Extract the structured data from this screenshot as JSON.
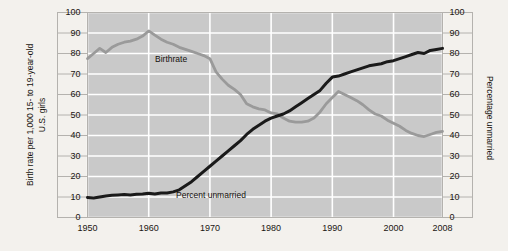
{
  "figure": {
    "background_color": "#f3f1ed",
    "plot_background_color": "#c9c9c9",
    "gridline_color": "#ffffff",
    "frame_color": "#b4b2ae"
  },
  "labels": {
    "left_axis_line1": "Birth rate per 1,000 15- to 19-year-old",
    "left_axis_line2": "U.S. girls",
    "right_axis": "Percentage unmarried",
    "birthrate_label": "Birthrate",
    "unmarried_label": "Percent unmarried"
  },
  "chart_data": {
    "type": "line",
    "title": "",
    "xlabel": "",
    "ylabel": "Birth rate per 1,000 15- to 19-year-old U.S. girls",
    "y2label": "Percentage unmarried",
    "grid": true,
    "legend": "inline-annotations",
    "xlim": [
      1950,
      2008
    ],
    "ylim": [
      0,
      100
    ],
    "y2lim": [
      0,
      100
    ],
    "xticks": [
      1950,
      1960,
      1970,
      1980,
      1990,
      2000,
      2008
    ],
    "xtick_labels": [
      "1950",
      "1960",
      "1970",
      "1980",
      "1990",
      "2000",
      "2008"
    ],
    "yticks": [
      0,
      10,
      20,
      30,
      40,
      50,
      60,
      70,
      80,
      90,
      100
    ],
    "ytick_labels": [
      "0",
      "10",
      "20",
      "30",
      "40",
      "50",
      "60",
      "70",
      "80",
      "90",
      "100"
    ],
    "y2ticks": [
      0,
      10,
      20,
      30,
      40,
      50,
      60,
      70,
      80,
      90,
      100
    ],
    "y2tick_labels": [
      "0",
      "10",
      "20",
      "30",
      "40",
      "50",
      "60",
      "70",
      "80",
      "90",
      "100"
    ],
    "series": [
      {
        "name": "Birthrate",
        "color": "#9a9a9a",
        "axis": "left",
        "x": [
          1950,
          1951,
          1952,
          1953,
          1954,
          1955,
          1956,
          1957,
          1958,
          1959,
          1960,
          1961,
          1962,
          1963,
          1964,
          1965,
          1966,
          1967,
          1968,
          1969,
          1970,
          1971,
          1972,
          1973,
          1974,
          1975,
          1976,
          1977,
          1978,
          1979,
          1980,
          1981,
          1982,
          1983,
          1984,
          1985,
          1986,
          1987,
          1988,
          1989,
          1990,
          1991,
          1992,
          1993,
          1994,
          1995,
          1996,
          1997,
          1998,
          1999,
          2000,
          2001,
          2002,
          2003,
          2004,
          2005,
          2006,
          2007,
          2008
        ],
        "values": [
          77.5,
          80.0,
          82.5,
          80.5,
          83.0,
          84.5,
          85.5,
          86.0,
          87.0,
          88.5,
          91.0,
          89.0,
          87.0,
          85.5,
          84.5,
          83.0,
          82.0,
          81.0,
          80.0,
          79.0,
          77.5,
          71.0,
          67.5,
          64.5,
          62.5,
          60.0,
          55.5,
          54.0,
          53.0,
          52.5,
          51.0,
          50.5,
          48.5,
          47.0,
          46.5,
          46.5,
          47.0,
          48.5,
          51.5,
          55.5,
          58.5,
          61.5,
          60.0,
          58.5,
          57.0,
          55.0,
          52.5,
          50.5,
          49.5,
          47.5,
          46.0,
          44.5,
          42.5,
          41.0,
          40.0,
          39.5,
          40.5,
          41.5,
          42.0
        ]
      },
      {
        "name": "Percent unmarried",
        "color": "#1a1a1a",
        "axis": "right",
        "x": [
          1950,
          1951,
          1952,
          1953,
          1954,
          1955,
          1956,
          1957,
          1958,
          1959,
          1960,
          1961,
          1962,
          1963,
          1964,
          1965,
          1966,
          1967,
          1968,
          1969,
          1970,
          1971,
          1972,
          1973,
          1974,
          1975,
          1976,
          1977,
          1978,
          1979,
          1980,
          1981,
          1982,
          1983,
          1984,
          1985,
          1986,
          1987,
          1988,
          1989,
          1990,
          1991,
          1992,
          1993,
          1994,
          1995,
          1996,
          1997,
          1998,
          1999,
          2000,
          2001,
          2002,
          2003,
          2004,
          2005,
          2006,
          2007,
          2008
        ],
        "values": [
          9.8,
          9.5,
          10.0,
          10.5,
          10.8,
          11.0,
          11.2,
          11.0,
          11.3,
          11.5,
          11.8,
          11.5,
          12.0,
          12.0,
          12.5,
          13.5,
          15.5,
          17.5,
          20.0,
          22.5,
          25.0,
          27.5,
          30.0,
          32.5,
          35.0,
          37.5,
          40.5,
          43.0,
          45.0,
          47.0,
          48.5,
          49.5,
          50.5,
          52.0,
          54.0,
          56.0,
          58.0,
          60.0,
          62.0,
          65.5,
          68.5,
          69.0,
          70.0,
          71.0,
          72.0,
          73.0,
          74.0,
          74.5,
          75.0,
          76.0,
          76.5,
          77.5,
          78.5,
          79.5,
          80.5,
          80.0,
          81.5,
          82.0,
          82.5
        ]
      }
    ]
  }
}
